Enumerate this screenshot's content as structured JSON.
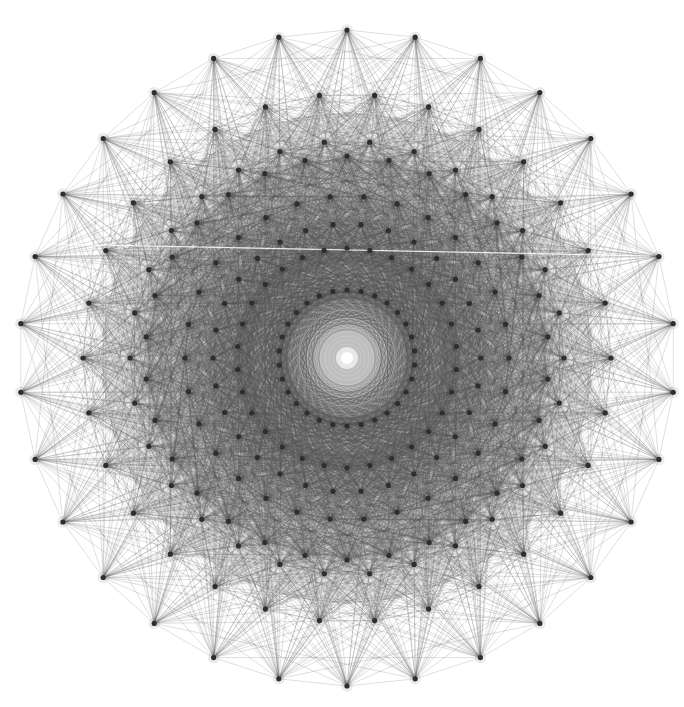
{
  "figure": {
    "title": "E8 polytope Petrie polygon projection",
    "width": 684,
    "height": 707,
    "center": [
      347,
      358
    ],
    "background": "#ffffff",
    "edge_color": "#555555",
    "vertex_color": "#2e2e2e",
    "vertex_radius": 2.6,
    "center_dot": {
      "radius": 6,
      "halo_radius": 11,
      "color": "#ffffff"
    },
    "shading": [
      {
        "radius": 245,
        "color": "#cfcfcf",
        "opacity": 0.55
      },
      {
        "radius": 200,
        "color": "#a9a9a9",
        "opacity": 0.45
      },
      {
        "radius": 120,
        "color": "#9a9a9a",
        "opacity": 0.25
      }
    ],
    "rings": [
      {
        "name": "ring-1",
        "radius": 328,
        "count": 30,
        "top_aligned": true
      },
      {
        "name": "ring-2",
        "radius": 264,
        "count": 30,
        "top_aligned": false
      },
      {
        "name": "ring-3",
        "radius": 217,
        "count": 30,
        "top_aligned": false
      },
      {
        "name": "ring-4",
        "radius": 202,
        "count": 30,
        "top_aligned": true
      },
      {
        "name": "ring-5",
        "radius": 162,
        "count": 30,
        "top_aligned": false
      },
      {
        "name": "ring-6",
        "radius": 134,
        "count": 30,
        "top_aligned": false
      },
      {
        "name": "ring-7",
        "radius": 110,
        "count": 30,
        "top_aligned": true
      },
      {
        "name": "ring-8",
        "radius": 68,
        "count": 30,
        "top_aligned": true
      }
    ],
    "artifact_line": {
      "from": [
        45,
        244
      ],
      "to": [
        650,
        256
      ],
      "color": "#ffffff"
    },
    "total_vertices": 240
  }
}
